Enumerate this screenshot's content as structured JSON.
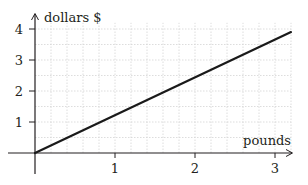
{
  "chart_data": {
    "type": "line",
    "title": "",
    "xlabel": "pounds",
    "ylabel": "dollars $",
    "xlim": [
      0,
      3.2
    ],
    "ylim": [
      0,
      4.2
    ],
    "x_ticks": [
      1,
      2,
      3
    ],
    "y_ticks": [
      1,
      2,
      3,
      4
    ],
    "x_tick_labels": [
      "1",
      "2",
      "3"
    ],
    "y_tick_labels": [
      "1",
      "2",
      "3",
      "4"
    ],
    "grid": true,
    "grid_minor_x_step": 0.2,
    "grid_minor_y_step": 0.5,
    "legend": null,
    "series": [
      {
        "name": "dollars vs pounds",
        "x": [
          0,
          3.2
        ],
        "y": [
          0,
          3.9
        ],
        "color": "#1a1a1a"
      }
    ]
  },
  "colors": {
    "axis": "#231f20",
    "grid": "#d4d4d4",
    "line": "#1a1a1a"
  }
}
